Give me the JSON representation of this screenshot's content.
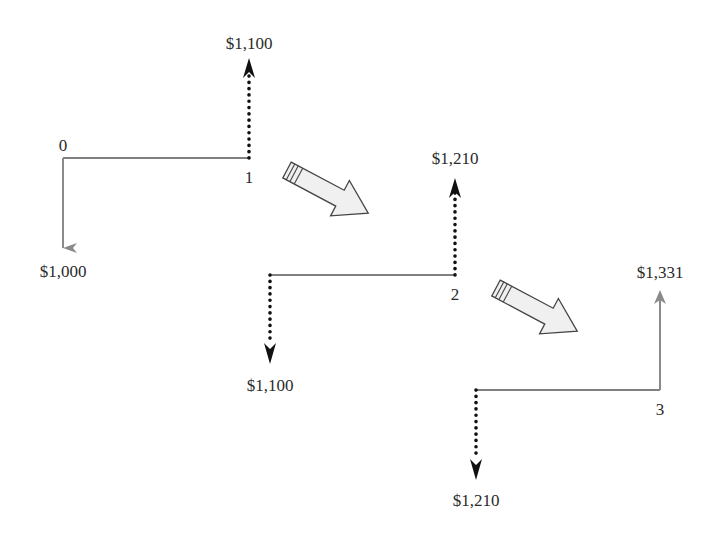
{
  "diagram": {
    "title": "",
    "colors": {
      "timeline": "#555555",
      "principal_arrow": "#8a8a8a",
      "dotted_arrow": "#111111",
      "block_arrow_fill": "#f0f0f0",
      "block_arrow_stroke": "#444444",
      "text": "#2a2a2a"
    },
    "stages": [
      {
        "start_period": "0",
        "end_period": "1",
        "outflow": "$1,000",
        "inflow": "$1,100",
        "outflow_style": "solid-gray",
        "inflow_style": "dotted-black"
      },
      {
        "start_period": "",
        "end_period": "2",
        "outflow": "$1,100",
        "inflow": "$1,210",
        "outflow_style": "dotted-black",
        "inflow_style": "dotted-black"
      },
      {
        "start_period": "",
        "end_period": "3",
        "outflow": "$1,210",
        "inflow": "$1,331",
        "outflow_style": "dotted-black",
        "inflow_style": "solid-gray"
      }
    ],
    "connectors": [
      {
        "from_stage": 1,
        "to_stage": 2,
        "icon": "block-arrow-right-down"
      },
      {
        "from_stage": 2,
        "to_stage": 3,
        "icon": "block-arrow-right-down"
      }
    ]
  }
}
